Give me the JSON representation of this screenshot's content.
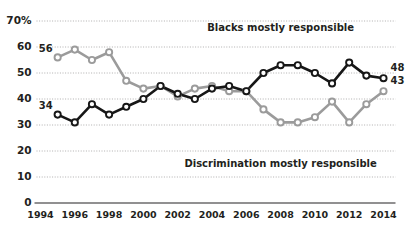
{
  "chart_data": {
    "type": "line",
    "title": "",
    "xlabel": "",
    "ylabel": "",
    "ylim": [
      0,
      70
    ],
    "xlim": [
      1994,
      2014
    ],
    "grid": true,
    "legend_position": "inline-annotation",
    "y_ticks": [
      "70%",
      "60",
      "50",
      "40",
      "30",
      "20",
      "10",
      "0"
    ],
    "y_tick_values": [
      70,
      60,
      50,
      40,
      30,
      20,
      10,
      0
    ],
    "x_ticks": [
      "1994",
      "1996",
      "1998",
      "2000",
      "2002",
      "2004",
      "2006",
      "2008",
      "2010",
      "2012",
      "2014"
    ],
    "x_tick_values": [
      1994,
      1996,
      1998,
      2000,
      2002,
      2004,
      2006,
      2008,
      2010,
      2012,
      2014
    ],
    "x": [
      1995,
      1996,
      1997,
      1998,
      1999,
      2000,
      2001,
      2002,
      2003,
      2004,
      2005,
      2006,
      2007,
      2008,
      2009,
      2010,
      2011,
      2012,
      2013,
      2014
    ],
    "series": [
      {
        "name": "Blacks mostly responsible",
        "color": "#171717",
        "values": [
          34,
          31,
          38,
          34,
          37,
          40,
          45,
          42,
          40,
          44,
          45,
          43,
          50,
          53,
          53,
          50,
          46,
          54,
          49,
          48
        ],
        "start_label": "34",
        "end_label": "48"
      },
      {
        "name": "Discrimination mostly responsible",
        "color": "#9b9b9b",
        "values": [
          56,
          59,
          55,
          58,
          47,
          44,
          45,
          41,
          44,
          45,
          43,
          43,
          36,
          31,
          31,
          33,
          39,
          31,
          38,
          43
        ],
        "start_label": "56",
        "end_label": "43"
      }
    ],
    "annotations": [
      {
        "text": "Blacks mostly responsible",
        "x": 2008,
        "y": 66
      },
      {
        "text": "Discrimination mostly responsible",
        "x": 2008,
        "y": 14
      }
    ]
  }
}
